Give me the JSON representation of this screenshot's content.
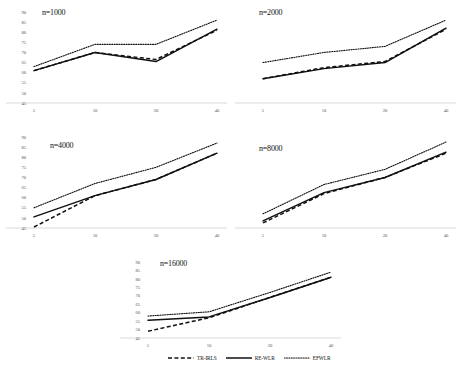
{
  "figure": {
    "legend": {
      "items": [
        {
          "label": "TR-IRLS",
          "style": "dashed",
          "name": "legend-tr-irls"
        },
        {
          "label": "RE-WLR",
          "style": "solid",
          "name": "legend-re-wlr"
        },
        {
          "label": "EFWLR",
          "style": "dotted",
          "name": "legend-efwlr"
        }
      ]
    }
  },
  "chart_data": [
    {
      "type": "line",
      "title": "n=1000",
      "xlabel": "",
      "ylabel": "",
      "x": [
        5,
        10,
        20,
        40
      ],
      "xticklabels": [
        "5",
        "10",
        "20",
        "40"
      ],
      "yticklabels": [
        "90",
        "85",
        "80",
        "75",
        "70",
        "65",
        "60",
        "55",
        "50",
        "45"
      ],
      "ylim": [
        45,
        90
      ],
      "grid": false,
      "legend_position": "figure-bottom-center",
      "series": [
        {
          "name": "TR-IRLS",
          "style": "dashed",
          "values": [
            61.0,
            70.0,
            66.5,
            81.0
          ]
        },
        {
          "name": "RE-WLR",
          "style": "solid",
          "values": [
            61.0,
            70.0,
            65.5,
            81.5
          ]
        },
        {
          "name": "EFWLR",
          "style": "dotted",
          "values": [
            63.0,
            74.0,
            74.0,
            86.0
          ]
        }
      ]
    },
    {
      "type": "line",
      "title": "n=2000",
      "xlabel": "",
      "ylabel": "",
      "x": [
        5,
        10,
        20,
        40
      ],
      "xticklabels": [
        "5",
        "10",
        "20",
        "40"
      ],
      "yticklabels": [],
      "ylim": [
        45,
        90
      ],
      "grid": false,
      "legend_position": "figure-bottom-center",
      "series": [
        {
          "name": "TR-IRLS",
          "style": "dashed",
          "values": [
            57.0,
            62.5,
            65.5,
            81.5
          ]
        },
        {
          "name": "RE-WLR",
          "style": "solid",
          "values": [
            57.0,
            62.0,
            65.0,
            82.0
          ]
        },
        {
          "name": "EFWLR",
          "style": "dotted",
          "values": [
            65.0,
            70.0,
            73.0,
            86.0
          ]
        }
      ]
    },
    {
      "type": "line",
      "title": "n=4000",
      "xlabel": "",
      "ylabel": "",
      "x": [
        5,
        10,
        20,
        40
      ],
      "xticklabels": [
        "5",
        "10",
        "20",
        "40"
      ],
      "yticklabels": [
        "90",
        "85",
        "80",
        "75",
        "70",
        "65",
        "60",
        "55",
        "50",
        "45"
      ],
      "ylim": [
        45,
        90
      ],
      "grid": false,
      "legend_position": "figure-bottom-center",
      "series": [
        {
          "name": "TR-IRLS",
          "style": "dashed",
          "values": [
            45.5,
            61.0,
            69.0,
            82.0
          ]
        },
        {
          "name": "RE-WLR",
          "style": "solid",
          "values": [
            50.5,
            61.0,
            69.0,
            82.0
          ]
        },
        {
          "name": "EFWLR",
          "style": "dotted",
          "values": [
            55.0,
            67.0,
            75.0,
            87.0
          ]
        }
      ]
    },
    {
      "type": "line",
      "title": "n=8000",
      "xlabel": "",
      "ylabel": "",
      "x": [
        5,
        10,
        20,
        40
      ],
      "xticklabels": [
        "5",
        "10",
        "20",
        "40"
      ],
      "yticklabels": [],
      "ylim": [
        45,
        90
      ],
      "grid": false,
      "legend_position": "figure-bottom-center",
      "series": [
        {
          "name": "TR-IRLS",
          "style": "dashed",
          "values": [
            47.5,
            62.0,
            70.0,
            82.0
          ]
        },
        {
          "name": "RE-WLR",
          "style": "solid",
          "values": [
            48.5,
            62.5,
            70.0,
            82.5
          ]
        },
        {
          "name": "EFWLR",
          "style": "dotted",
          "values": [
            52.0,
            66.5,
            74.0,
            87.5
          ]
        }
      ]
    },
    {
      "type": "line",
      "title": "n=16000",
      "xlabel": "",
      "ylabel": "",
      "x": [
        5,
        10,
        20,
        40
      ],
      "xticklabels": [
        "5",
        "10",
        "20",
        "40"
      ],
      "yticklabels": [
        "90",
        "85",
        "80",
        "75",
        "70",
        "65",
        "60",
        "55",
        "50",
        "45"
      ],
      "ylim": [
        45,
        90
      ],
      "grid": false,
      "legend_position": "figure-bottom-center",
      "series": [
        {
          "name": "TR-IRLS",
          "style": "dashed",
          "values": [
            49.0,
            57.0,
            69.0,
            81.0
          ]
        },
        {
          "name": "RE-WLR",
          "style": "solid",
          "values": [
            55.5,
            57.5,
            69.0,
            81.0
          ]
        },
        {
          "name": "EFWLR",
          "style": "dotted",
          "values": [
            58.0,
            60.5,
            72.0,
            84.0
          ]
        }
      ]
    }
  ]
}
